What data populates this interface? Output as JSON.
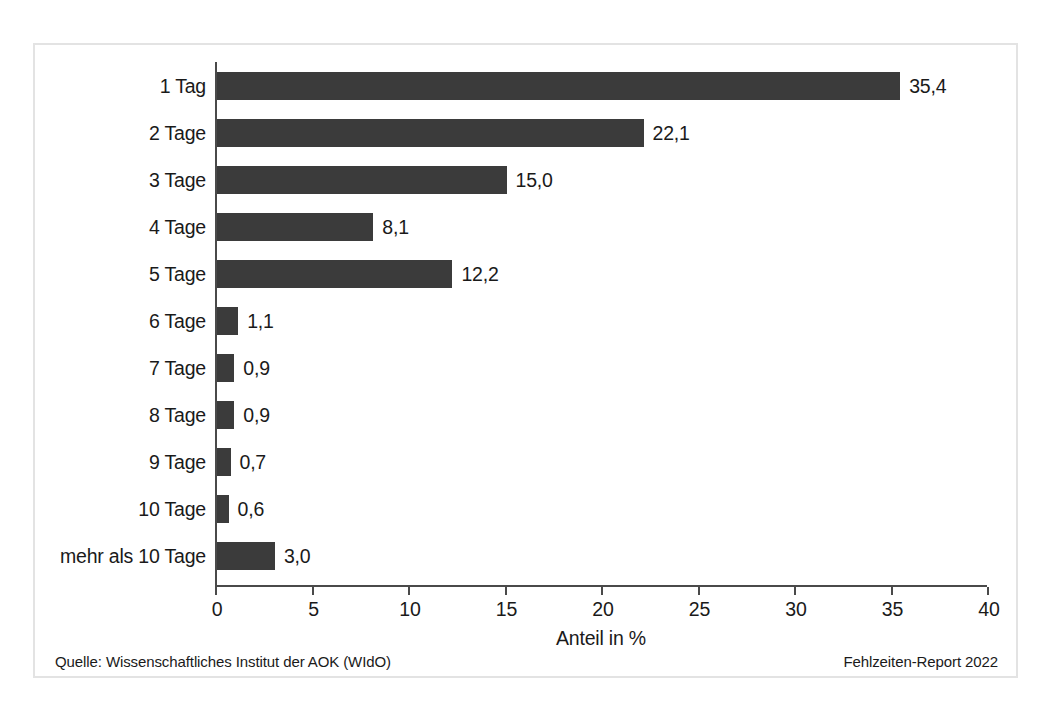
{
  "chart_data": {
    "type": "bar",
    "orientation": "horizontal",
    "title": "",
    "xlabel": "Anteil in %",
    "ylabel": "",
    "xlim": [
      0,
      40
    ],
    "xticks": [
      "0",
      "5",
      "10",
      "15",
      "20",
      "25",
      "30",
      "35",
      "40"
    ],
    "grid": false,
    "legend": null,
    "bar_color": "#3b3b3b",
    "categories": [
      "1 Tag",
      "2 Tage",
      "3 Tage",
      "4 Tage",
      "5 Tage",
      "6 Tage",
      "7 Tage",
      "8 Tage",
      "9 Tage",
      "10 Tage",
      "mehr als 10 Tage"
    ],
    "values": [
      35.4,
      22.1,
      15.0,
      8.1,
      12.2,
      1.1,
      0.9,
      0.9,
      0.7,
      0.6,
      3.0
    ],
    "value_labels": [
      "35,4",
      "22,1",
      "15,0",
      "8,1",
      "12,2",
      "1,1",
      "0,9",
      "0,9",
      "0,7",
      "0,6",
      "3,0"
    ]
  },
  "footer": {
    "source": "Quelle: Wissenschaftliches Institut der AOK (WIdO)",
    "report": "Fehlzeiten-Report 2022"
  }
}
